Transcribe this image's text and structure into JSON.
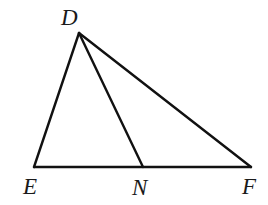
{
  "figure": {
    "kind": "triangle-with-cevian",
    "background_color": "#ffffff",
    "stroke_color": "#111111",
    "stroke_width": 2.4,
    "width": 268,
    "height": 205,
    "labels": {
      "apex": "D",
      "bottom_left": "E",
      "bottom_mid": "N",
      "bottom_right": "F"
    },
    "points": {
      "D": {
        "x": 79,
        "y": 33,
        "label": "D"
      },
      "E": {
        "x": 34,
        "y": 167,
        "label": "E"
      },
      "N": {
        "x": 143,
        "y": 167,
        "label": "N"
      },
      "F": {
        "x": 251,
        "y": 167,
        "label": "F"
      }
    },
    "segments": [
      {
        "name": "DE",
        "from": "D",
        "to": "E"
      },
      {
        "name": "DF",
        "from": "D",
        "to": "F"
      },
      {
        "name": "DN",
        "from": "D",
        "to": "N"
      },
      {
        "name": "EF",
        "from": "E",
        "to": "F"
      }
    ]
  }
}
